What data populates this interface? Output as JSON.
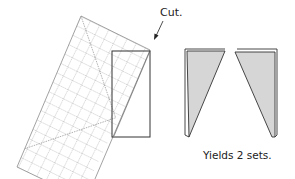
{
  "diagram": {
    "cut_label": "Cut.",
    "yield_label": "Yields 2 sets.",
    "colors": {
      "ruler_line": "#777777",
      "outline": "#333333",
      "triangle_fill": "#d6d6d6",
      "background": "#ffffff"
    },
    "elements": [
      {
        "name": "quilting-ruler",
        "type": "rotated grid rectangle",
        "rotation_deg": -63
      },
      {
        "name": "fabric-rectangle",
        "type": "rectangle"
      },
      {
        "name": "cut-arrow",
        "type": "arrow",
        "points_to": "fabric-rectangle top-right corner"
      },
      {
        "name": "left-triangle-piece",
        "type": "shaded triangle"
      },
      {
        "name": "right-triangle-piece",
        "type": "shaded triangle"
      }
    ]
  }
}
